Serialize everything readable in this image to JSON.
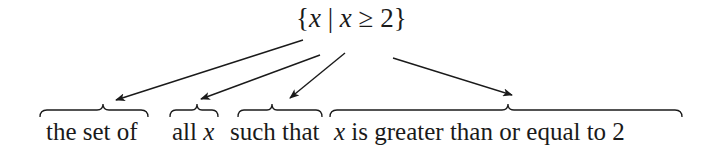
{
  "expression": {
    "open_brace": "{",
    "var1": "x",
    "bar": "|",
    "var2": "x",
    "relation": "≥ 2",
    "close_brace": "}"
  },
  "phrases": [
    {
      "text": "the set of"
    },
    {
      "prefix": "all ",
      "var": "x"
    },
    {
      "text": "such that"
    },
    {
      "var": "x",
      "suffix": " is greater than or equal to 2"
    }
  ],
  "colors": {
    "ink": "#1a1a1a",
    "background": "#ffffff"
  }
}
